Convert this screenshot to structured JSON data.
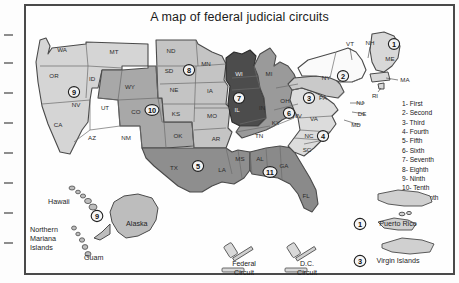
{
  "figure": {
    "title": "A map of federal judicial circuits"
  },
  "colors": {
    "circuit_1": "#d8d8d8",
    "circuit_2": "#fafafa",
    "circuit_3": "#c9c9c9",
    "circuit_4": "#dcdcdc",
    "circuit_5": "#8e8e8e",
    "circuit_6": "#9a9a9a",
    "circuit_7": "#4c4c4c",
    "circuit_8": "#c4c4c4",
    "circuit_9": "#d5d5d5",
    "circuit_10": "#a8a8a8",
    "circuit_11": "#8a8a8a",
    "border": "#4a4a4a",
    "state_line": "#6b6b6b",
    "text": "#1c1c1c"
  },
  "legend": {
    "items": [
      {
        "number": "1",
        "label": "1- First"
      },
      {
        "number": "2",
        "label": "2- Second"
      },
      {
        "number": "3",
        "label": "3- Third"
      },
      {
        "number": "4",
        "label": "4- Fourth"
      },
      {
        "number": "5",
        "label": "5- Fifth"
      },
      {
        "number": "6",
        "label": "6- Sixth"
      },
      {
        "number": "7",
        "label": "7- Seventh"
      },
      {
        "number": "8",
        "label": "8- Eighth"
      },
      {
        "number": "9",
        "label": "9- Ninth"
      },
      {
        "number": "10",
        "label": "10- Tenth"
      },
      {
        "number": "11",
        "label": "11- Eleventh"
      }
    ]
  },
  "states": [
    {
      "code": "WA",
      "x": 36,
      "y": 24,
      "dark": false
    },
    {
      "code": "MT",
      "x": 88,
      "y": 26,
      "dark": false
    },
    {
      "code": "OR",
      "x": 28,
      "y": 50,
      "dark": false
    },
    {
      "code": "ID",
      "x": 66,
      "y": 53,
      "dark": false
    },
    {
      "code": "WY",
      "x": 104,
      "y": 61,
      "dark": false
    },
    {
      "code": "NV",
      "x": 50,
      "y": 79,
      "dark": false
    },
    {
      "code": "UT",
      "x": 79,
      "y": 82,
      "dark": false
    },
    {
      "code": "CO",
      "x": 110,
      "y": 86,
      "dark": false
    },
    {
      "code": "CA",
      "x": 32,
      "y": 99,
      "dark": false
    },
    {
      "code": "AZ",
      "x": 66,
      "y": 112,
      "dark": false
    },
    {
      "code": "NM",
      "x": 100,
      "y": 112,
      "dark": false
    },
    {
      "code": "ND",
      "x": 145,
      "y": 25,
      "dark": false
    },
    {
      "code": "SD",
      "x": 143,
      "y": 45,
      "dark": false
    },
    {
      "code": "MN",
      "x": 180,
      "y": 38,
      "dark": false
    },
    {
      "code": "NE",
      "x": 148,
      "y": 64,
      "dark": false
    },
    {
      "code": "IA",
      "x": 184,
      "y": 65,
      "dark": false
    },
    {
      "code": "KS",
      "x": 150,
      "y": 88,
      "dark": false
    },
    {
      "code": "MO",
      "x": 186,
      "y": 90,
      "dark": false
    },
    {
      "code": "WI",
      "x": 213,
      "y": 48,
      "dark": true
    },
    {
      "code": "IL",
      "x": 211,
      "y": 84,
      "dark": true
    },
    {
      "code": "IN",
      "x": 236,
      "y": 82,
      "dark": false
    },
    {
      "code": "MI",
      "x": 243,
      "y": 48,
      "dark": false
    },
    {
      "code": "OH",
      "x": 259,
      "y": 75,
      "dark": false
    },
    {
      "code": "KY",
      "x": 250,
      "y": 97,
      "dark": false
    },
    {
      "code": "TN",
      "x": 233,
      "y": 110,
      "dark": false
    },
    {
      "code": "OK",
      "x": 152,
      "y": 110,
      "dark": false
    },
    {
      "code": "AR",
      "x": 190,
      "y": 113,
      "dark": false
    },
    {
      "code": "TX",
      "x": 148,
      "y": 142,
      "dark": false
    },
    {
      "code": "LA",
      "x": 196,
      "y": 144,
      "dark": false
    },
    {
      "code": "MS",
      "x": 214,
      "y": 133,
      "dark": false
    },
    {
      "code": "AL",
      "x": 234,
      "y": 133,
      "dark": false
    },
    {
      "code": "GA",
      "x": 258,
      "y": 140,
      "dark": false
    },
    {
      "code": "FL",
      "x": 280,
      "y": 170,
      "dark": false
    },
    {
      "code": "SC",
      "x": 281,
      "y": 124,
      "dark": false
    },
    {
      "code": "NC",
      "x": 283,
      "y": 110,
      "dark": false
    },
    {
      "code": "VA",
      "x": 288,
      "y": 93,
      "dark": false
    },
    {
      "code": "WV",
      "x": 271,
      "y": 90,
      "dark": false
    },
    {
      "code": "PA",
      "x": 297,
      "y": 72,
      "dark": false
    },
    {
      "code": "NY",
      "x": 300,
      "y": 52,
      "dark": false
    }
  ],
  "callout_states": [
    {
      "code": "VT",
      "x": 324,
      "y": 18
    },
    {
      "code": "NH",
      "x": 344,
      "y": 17
    },
    {
      "code": "ME",
      "x": 364,
      "y": 33
    },
    {
      "code": "MA",
      "x": 379,
      "y": 54
    },
    {
      "code": "RI",
      "x": 349,
      "y": 70
    },
    {
      "code": "NJ",
      "x": 334,
      "y": 77
    },
    {
      "code": "DE",
      "x": 336,
      "y": 88
    },
    {
      "code": "MD",
      "x": 330,
      "y": 99
    }
  ],
  "circuit_markers": [
    {
      "number": "1",
      "x": 368,
      "y": 18
    },
    {
      "number": "2",
      "x": 317,
      "y": 50
    },
    {
      "number": "3",
      "x": 283,
      "y": 72
    },
    {
      "number": "4",
      "x": 297,
      "y": 110
    },
    {
      "number": "5",
      "x": 172,
      "y": 140
    },
    {
      "number": "6",
      "x": 263,
      "y": 87
    },
    {
      "number": "7",
      "x": 213,
      "y": 72
    },
    {
      "number": "8",
      "x": 163,
      "y": 44
    },
    {
      "number": "9",
      "x": 48,
      "y": 66
    },
    {
      "number": "10",
      "x": 126,
      "y": 84
    },
    {
      "number": "11",
      "x": 244,
      "y": 146
    }
  ],
  "territories": [
    {
      "name": "Hawaii",
      "x": 22,
      "y": 176
    },
    {
      "name": "Northern",
      "x": 4,
      "y": 204
    },
    {
      "name": "Mariana",
      "x": 4,
      "y": 213
    },
    {
      "name": "Islands",
      "x": 4,
      "y": 222
    },
    {
      "name": "Guam",
      "x": 58,
      "y": 232
    },
    {
      "name": "Alaska",
      "x": 100,
      "y": 198
    }
  ],
  "territory_marker": {
    "number": "9",
    "x": 71,
    "y": 190
  },
  "special_courts": [
    {
      "line1": "Federal",
      "line2": "Circuit",
      "x": 218,
      "y": 238
    },
    {
      "line1": "D.C.",
      "line2": "Circuit",
      "x": 281,
      "y": 238
    }
  ],
  "inset_territories": [
    {
      "number": "1",
      "label": "Puerto Rico",
      "x": 372,
      "y": 198
    },
    {
      "number": "3",
      "label": "Virgin Islands",
      "x": 372,
      "y": 235
    }
  ]
}
